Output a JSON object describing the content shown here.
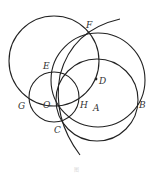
{
  "figure": {
    "type": "geometry-construction",
    "stroke_color": "#222222",
    "label_color": "#333333",
    "labels": {
      "F": "F",
      "E": "E",
      "D": "D",
      "G": "G",
      "O": "O",
      "H": "H",
      "A": "A",
      "B": "B",
      "C": "C"
    },
    "caption": "图",
    "elements": [
      {
        "kind": "circle",
        "name": "large-top-left-circle"
      },
      {
        "kind": "circle",
        "name": "large-right-circle",
        "through": [
          "F",
          "B"
        ]
      },
      {
        "kind": "circle",
        "name": "medium-circle",
        "through": [
          "B",
          "C"
        ]
      },
      {
        "kind": "circle",
        "name": "small-circle-center-O",
        "through": [
          "G",
          "H",
          "E",
          "C"
        ]
      },
      {
        "kind": "arc",
        "name": "long-arc",
        "through": [
          "F",
          "O",
          "C"
        ]
      },
      {
        "kind": "point",
        "name": "point-D"
      }
    ]
  }
}
